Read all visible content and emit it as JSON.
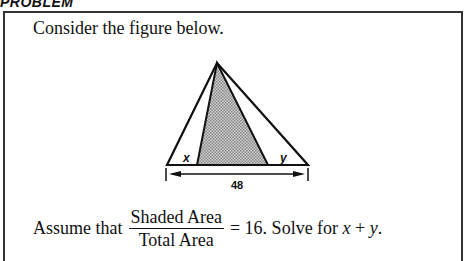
{
  "header": {
    "title": "PROBLEM"
  },
  "problem": {
    "intro": "Consider the figure below.",
    "statement": {
      "prefix": "Assume that",
      "numerator": "Shaded Area",
      "denominator": "Total Area",
      "equals": "= 16. Solve for",
      "var_x": "x",
      "plus": "+",
      "var_y": "y",
      "end": "."
    }
  },
  "figure": {
    "label_x": "x",
    "label_y": "y",
    "base_length": "48",
    "shade_color": "#b8b8b8",
    "line_color": "#111111"
  }
}
